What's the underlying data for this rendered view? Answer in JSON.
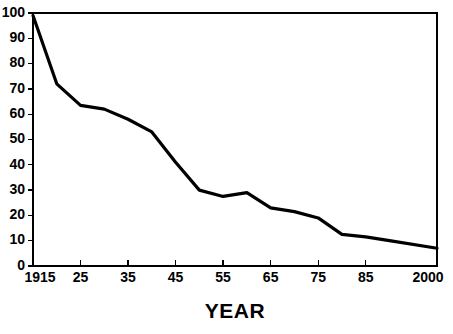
{
  "chart_data": {
    "type": "line",
    "title": "",
    "subtitle": "",
    "xlabel": "YEAR",
    "ylabel": "",
    "xlim": [
      1915,
      2000
    ],
    "ylim": [
      0,
      100
    ],
    "grid": true,
    "legend": false,
    "legend_position": "none",
    "line_color": "#000000",
    "grid_color": "#a8a8a8",
    "axis_color": "#000000",
    "background_color": "#ffffff",
    "x_tick_labels": [
      "1915",
      "25",
      "35",
      "45",
      "55",
      "65",
      "75",
      "85",
      "2000"
    ],
    "x_tick_values": [
      1915,
      1925,
      1935,
      1945,
      1955,
      1965,
      1975,
      1985,
      2000
    ],
    "y_tick_labels": [
      "0",
      "10",
      "20",
      "30",
      "40",
      "50",
      "60",
      "70",
      "80",
      "90",
      "100"
    ],
    "y_tick_values": [
      0,
      10,
      20,
      30,
      40,
      50,
      60,
      70,
      80,
      90,
      100
    ],
    "series": [
      {
        "name": "value",
        "x": [
          1915,
          1920,
          1925,
          1930,
          1935,
          1940,
          1945,
          1950,
          1955,
          1960,
          1965,
          1970,
          1975,
          1980,
          1985,
          1990,
          2000
        ],
        "values": [
          99,
          72,
          63.5,
          62,
          58,
          53,
          41,
          30,
          27.5,
          29,
          23,
          21.5,
          19,
          12.5,
          11.5,
          10,
          7
        ]
      }
    ]
  }
}
